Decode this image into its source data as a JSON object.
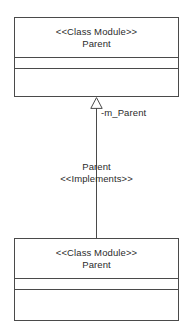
{
  "diagram": {
    "type": "uml-class-diagram",
    "background_color": "#ffffff",
    "line_color": "#4a4a4a",
    "text_color": "#2b2b2b",
    "parent_class": {
      "stereotype": "<<Class Module>>",
      "name": "Parent",
      "attributes": "",
      "operations": ""
    },
    "child_class": {
      "stereotype": "<<Class Module>>",
      "name": "Parent",
      "attributes": "",
      "operations": ""
    },
    "relationship": {
      "kind": "generalization",
      "arrowhead": "hollow-triangle",
      "role_label": "-m_Parent",
      "association_name": "Parent",
      "association_stereotype": "<<Implements>>"
    }
  }
}
